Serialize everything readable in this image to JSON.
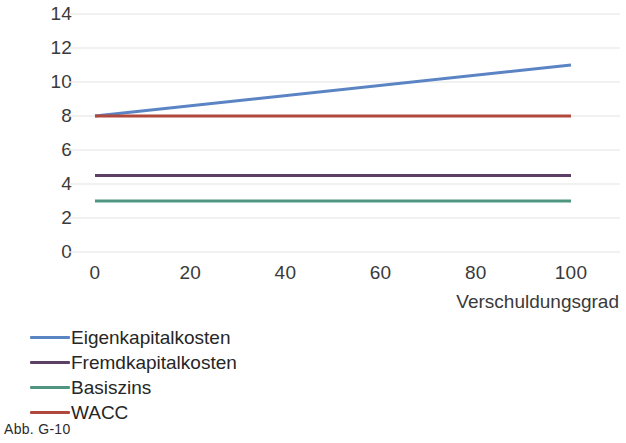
{
  "caption": "Abb. G-10",
  "chart_data": {
    "type": "line",
    "title": "",
    "subtitle": "",
    "xlabel": "Verschuldungsgrad",
    "ylabel": "",
    "x": [
      0,
      100
    ],
    "xlim": [
      0,
      100
    ],
    "ylim": [
      0,
      14
    ],
    "xticks": [
      0,
      20,
      40,
      60,
      80,
      100
    ],
    "yticks": [
      0,
      2,
      4,
      6,
      8,
      10,
      12,
      14
    ],
    "xtick_labels": [
      "0",
      "20",
      "40",
      "60",
      "80",
      "100"
    ],
    "ytick_labels": [
      "0",
      "2",
      "4",
      "6",
      "8",
      "10",
      "12",
      "14"
    ],
    "grid": true,
    "grid_axis": "y",
    "legend_position": "bottom-left",
    "series": [
      {
        "name": "Eigenkapitalkosten",
        "color": "#5b84c4",
        "values": [
          8.0,
          11.0
        ]
      },
      {
        "name": "Fremdkapitalkosten",
        "color": "#5c3f66",
        "values": [
          4.5,
          4.5
        ]
      },
      {
        "name": "Basiszins",
        "color": "#4e9680",
        "values": [
          3.0,
          3.0
        ]
      },
      {
        "name": "WACC",
        "color": "#b0483c",
        "values": [
          8.0,
          8.0
        ]
      }
    ]
  }
}
